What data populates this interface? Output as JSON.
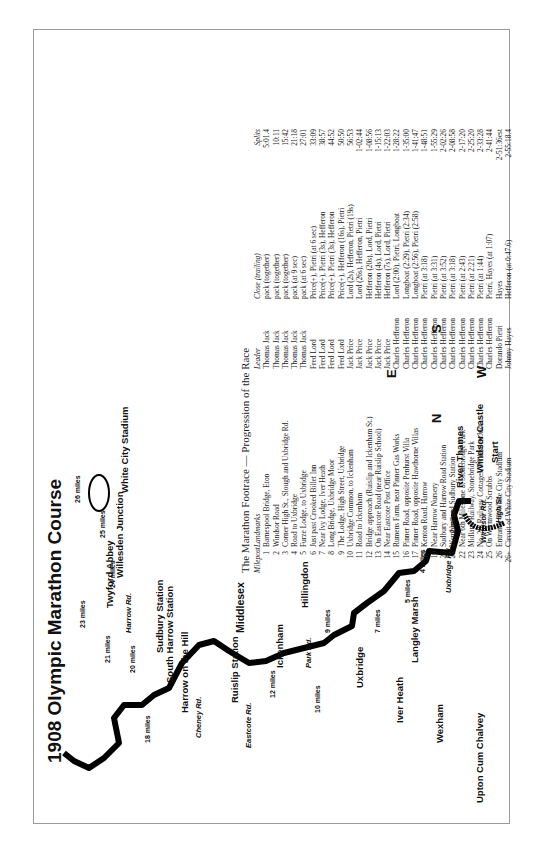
{
  "title": "1908 Olympic Marathon Course",
  "map": {
    "places": [
      {
        "id": "upton",
        "label": "Upton Cum Chalvey"
      },
      {
        "id": "wexham",
        "label": "Wexham"
      },
      {
        "id": "iver-heath",
        "label": "Iver Heath"
      },
      {
        "id": "uxbridge",
        "label": "Uxbridge"
      },
      {
        "id": "langley-marsh",
        "label": "Langley Marsh"
      },
      {
        "id": "ickenham",
        "label": "Ickenham"
      },
      {
        "id": "hillingdon",
        "label": "Hillingdon"
      },
      {
        "id": "ruislip-station",
        "label": "Ruislip Station"
      },
      {
        "id": "middlesex",
        "label": "Middlesex"
      },
      {
        "id": "harrow-hill",
        "label": "Harrow on the Hill"
      },
      {
        "id": "south-harrow",
        "label": "South Harrow Station"
      },
      {
        "id": "sudbury",
        "label": "Sudbury Station"
      },
      {
        "id": "twyford",
        "label": "Twyford Abbey"
      },
      {
        "id": "willesden",
        "label": "Willesden Junction"
      },
      {
        "id": "white-city",
        "label": "White City Stadium"
      },
      {
        "id": "river-thames",
        "label": "River Thames"
      },
      {
        "id": "windsor-castle",
        "label": "Windsor Castle"
      },
      {
        "id": "start",
        "label": "Start"
      }
    ],
    "roads": [
      "High St.",
      "Windsor Rd.",
      "Uxbridge Rd.",
      "Park Rd.",
      "Eastcote Rd.",
      "Cheney Rd.",
      "Harrow Rd."
    ],
    "mile_markers": [
      "2 miles",
      "4 miles",
      "5 miles",
      "7 miles",
      "9 miles",
      "10 miles",
      "12 miles",
      "18 miles",
      "20 miles",
      "21 miles",
      "23 miles",
      "24 miles",
      "25 miles",
      "26 miles"
    ],
    "compass": {
      "n": "N",
      "s": "S",
      "e": "E",
      "w": "W"
    }
  },
  "table": {
    "title": "The Marathon Footrace — Progression of the Race",
    "headers": {
      "milepost": "Milepost",
      "landmarks": "Landmarks",
      "leader": "Leader",
      "close": "Close (trailing)",
      "splits": "Splits"
    },
    "rows": [
      {
        "m": "1",
        "land": "Barnespool Bridge, Eton",
        "leader": "Thomas Jack",
        "close": "pack (together)",
        "split": "5:01.4"
      },
      {
        "m": "2",
        "land": "Windsor Road",
        "leader": "Thomas Jack",
        "close": "pack (together)",
        "split": "10:11"
      },
      {
        "m": "3",
        "land": "Corner High St., Slough and Uxbridge Rd.",
        "leader": "Thomas Jack",
        "close": "pack (together)",
        "split": "15:42"
      },
      {
        "m": "4",
        "land": "Road to Uxbridge",
        "leader": "Thomas Jack",
        "close": "pack (at 9 sec)",
        "split": "21:18"
      },
      {
        "m": "5",
        "land": "Furze Lodge, to Uxbridge",
        "leader": "Thomas Jack",
        "close": "pack (at 6 sec)",
        "split": "27:01"
      },
      {
        "m": "6",
        "land": "Just past Crooked Billet Inn",
        "leader": "Fred Lord",
        "close": "Price(+), Pietri (at 6 sec)",
        "split": "33:09"
      },
      {
        "m": "7",
        "land": "Near Ivy Lodge, Iver Heath",
        "leader": "Fred Lord",
        "close": "Price(+), Pietri (3s), Hefferon",
        "split": "38:57"
      },
      {
        "m": "8",
        "land": "Long Bridge, Uxbridge Moor",
        "leader": "Fred Lord",
        "close": "Price(+), Pietri (3s), Hefferon",
        "split": "44:52"
      },
      {
        "m": "9",
        "land": "The Lodge, High Street, Uxbridge",
        "leader": "Fred Lord",
        "close": "Price(+), Hefferon (16s), Pietri",
        "split": "50:50"
      },
      {
        "m": "10",
        "land": "Uxbridge Common, to Ickenham",
        "leader": "Jack Price",
        "close": "Lord (2s), Hefferon, Pietri (19s)",
        "split": "56:53"
      },
      {
        "m": "11",
        "land": "Road to Ickenham",
        "leader": "Jack Price",
        "close": "Lord (26s), Hefferon, Pietri",
        "split": "1-02:44"
      },
      {
        "m": "12",
        "land": "Bridge approach (Ruislip and Ickenham St.)",
        "leader": "Jack Price",
        "close": "Hefferon (20s), Lord, Pietri",
        "split": "1-08:56"
      },
      {
        "m": "13",
        "land": "On Eastcote Road (near Ruislip School)",
        "leader": "Jack Price",
        "close": "Hefferon (4s), Lord, Pietri",
        "split": "1-15:13"
      },
      {
        "m": "14",
        "land": "Near Eastcote Post Office",
        "leader": "Jack Price",
        "close": "Hefferon (7s), Lord, Pietri",
        "split": "1-22:03"
      },
      {
        "m": "15",
        "land": "Rumens Farm, near Pinner Gas Works",
        "leader": "Charles Hefferon",
        "close": "Lord (2:00), Pietri, Longboat",
        "split": "1-28:22"
      },
      {
        "m": "16",
        "land": "Pinner Road, opposite Penhurst Villa",
        "leader": "Charles Hefferon",
        "close": "Longboat (2:29), Pietri (2:34)",
        "split": "1-35:00"
      },
      {
        "m": "17",
        "land": "Pinner Road, opposite Hawthorne Villas",
        "leader": "Charles Hefferon",
        "close": "Longboat (2:56), Pietri (2:58)",
        "split": "1-41:47"
      },
      {
        "m": "18",
        "land": "Kenton Road, Harrow",
        "leader": "Charles Hefferon",
        "close": "Pietri (at 3:18)",
        "split": "1-48:51"
      },
      {
        "m": "19",
        "land": "Near Harrow Nursery",
        "leader": "Charles Hefferon",
        "close": "Pietri (at 3:31)",
        "split": "1-55:29"
      },
      {
        "m": "20",
        "land": "Sudbury and Harrow Road Station",
        "leader": "Charles Hefferon",
        "close": "Pietri (at 3:52)",
        "split": "2-02:26"
      },
      {
        "m": "21",
        "land": "Wembley and Sudbury Station",
        "leader": "Charles Hefferon",
        "close": "Pietri (at 3:18)",
        "split": "2-08:58"
      },
      {
        "m": "22",
        "land": "Near 6th Milestone at Stonebridge Park",
        "leader": "Charles Hefferon",
        "close": "Pietri (at 2:43)",
        "split": "2-17:20"
      },
      {
        "m": "23",
        "land": "Midland Railway, Stonebridge Park",
        "leader": "Charles Hefferon",
        "close": "Pietri (at 2:21)",
        "split": "2-25:20"
      },
      {
        "m": "24",
        "land": "No. 28, Railway Cottages, Willesden Jnct.",
        "leader": "Charles Hefferon",
        "close": "Pietri (at 1:44)",
        "split": "2-33:28"
      },
      {
        "m": "25",
        "land": "On Wormwood Scrubbs",
        "leader": "Charles Hefferon",
        "close": "Pietri, Hayes (at 1:07)",
        "split": "2-41:44"
      },
      {
        "m": "26",
        "land": "Entrance of White City Stadium",
        "leader": "Dorando Pietri",
        "close": "Hayes",
        "split": "2-51:36est"
      },
      {
        "m": "26+",
        "land": "Circuit of White City Stadium",
        "leader": "Johnny Hayes",
        "close": "Hefferon (at 0:47.6)",
        "split": "2-55:18.4"
      }
    ]
  }
}
